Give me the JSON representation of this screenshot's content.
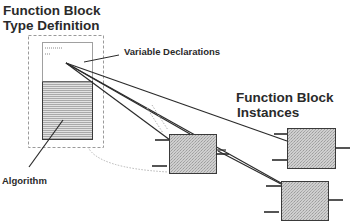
{
  "diagram": {
    "type_definition": {
      "title_line1": "Function Block",
      "title_line2": "Type Definition",
      "variable_declarations_label": "Variable Declarations",
      "algorithm_label": "Algorithm"
    },
    "instances": {
      "title_line1": "Function Block",
      "title_line2": "Instances",
      "count": 3,
      "items": [
        {
          "id": "instance-1",
          "position": "middle"
        },
        {
          "id": "instance-2",
          "position": "top-right"
        },
        {
          "id": "instance-3",
          "position": "bottom-right"
        }
      ]
    },
    "colors": {
      "line": "#2b2b2b",
      "dashed_border": "#9a9a9a",
      "block_fill": "#c9c9c9",
      "stripe": "#b5b5b5",
      "background": "#ffffff"
    }
  }
}
